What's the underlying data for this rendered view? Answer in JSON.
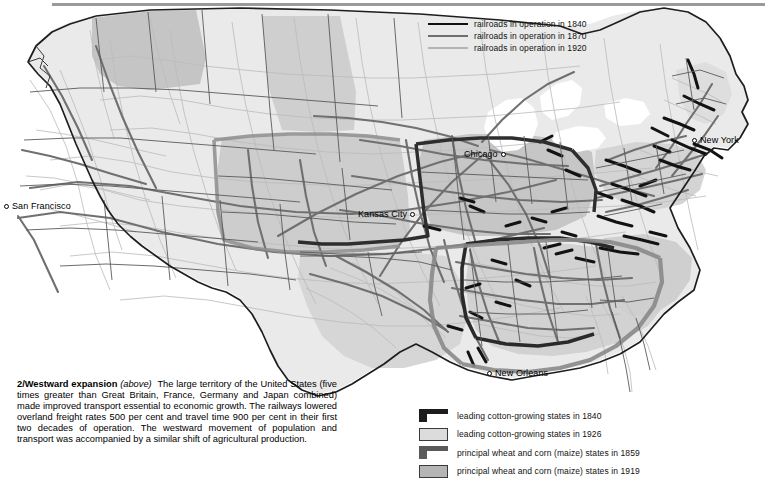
{
  "figure": {
    "number": "2/",
    "title": "Westward expansion",
    "above_note": "(above)",
    "body": "The large territory of the United States (five times greater than Great Britain, France, Germany and Japan combined) made improved transport essential to economic growth. The railways lowered overland freight rates 500 per cent and travel time 900 per cent in their first two decades of operation. The westward movement of population and transport was accompanied by a similar shift of agricultural production."
  },
  "railroad_legend": {
    "items": [
      {
        "label": "railroads in operation in 1840",
        "style": "thick-black",
        "color": "#111111",
        "year": "1840"
      },
      {
        "label": "railroads in operation in 1870",
        "style": "medium-gray",
        "color": "#6e6e6e",
        "year": "1870"
      },
      {
        "label": "railroads in operation in 1920",
        "style": "thin-light-gray",
        "color": "#b4b4b4",
        "year": "1920"
      }
    ]
  },
  "area_legend": {
    "items": [
      {
        "label": "leading cotton-growing states in 1840",
        "swatch": "dark-bracket",
        "color": "#1c1c1c",
        "year": "1840"
      },
      {
        "label": "leading cotton-growing states in 1926",
        "swatch": "light-filled-box",
        "color": "#dcdcdc",
        "year": "1926"
      },
      {
        "label": "principal wheat and corn (maize) states in 1859",
        "swatch": "mid-gray-bracket",
        "color": "#5a5a5a",
        "year": "1859"
      },
      {
        "label": "principal wheat and corn (maize) states in 1919",
        "swatch": "gray-filled-box",
        "color": "#b5b5b5",
        "year": "1919"
      }
    ]
  },
  "cities": [
    {
      "name": "San Francisco",
      "marker": "left"
    },
    {
      "name": "Kansas City",
      "marker": "right"
    },
    {
      "name": "Chicago",
      "marker": "right"
    },
    {
      "name": "New York",
      "marker": "left"
    },
    {
      "name": "New Orleans",
      "marker": "left"
    }
  ],
  "map": {
    "region": "United States",
    "base_fill": "#e9e9e9",
    "shaded_fill": "#c9c9c9",
    "outline_color": "#2a2a2a",
    "water_fill": "#ffffff"
  }
}
